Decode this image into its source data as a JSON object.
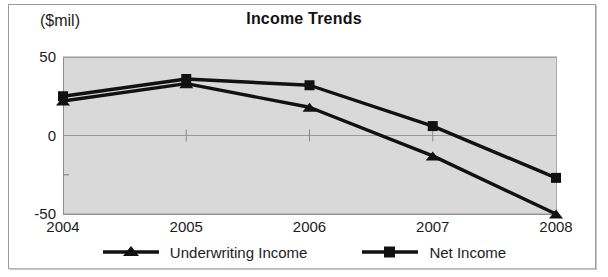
{
  "figure": {
    "axis_unit_label": "($mil)",
    "title": "Income Trends",
    "plot_bg_color": "#d9d9d9",
    "series_color": "#111111",
    "gridline_color": "#9a9a9a"
  },
  "legend": {
    "entries": [
      {
        "label": "Underwriting Income",
        "marker": "triangle-marker-icon"
      },
      {
        "label": "Net Income",
        "marker": "square-marker-icon"
      }
    ]
  },
  "chart_data": {
    "type": "line",
    "title": "Income Trends",
    "xlabel": "",
    "ylabel": "($mil)",
    "ylim": [
      -50,
      50
    ],
    "yticks": [
      50,
      0,
      -50
    ],
    "ytick_labels": [
      "50",
      "0",
      "-50"
    ],
    "yminor_ticks": [
      25,
      -25
    ],
    "grid": true,
    "legend_position": "bottom",
    "categories": [
      "2004",
      "2005",
      "2006",
      "2007",
      "2008"
    ],
    "series": [
      {
        "name": "Underwriting Income",
        "marker": "triangle",
        "values": [
          22,
          33,
          18,
          -13,
          -50
        ]
      },
      {
        "name": "Net Income",
        "marker": "square",
        "values": [
          25,
          36,
          32,
          6,
          -27
        ]
      }
    ]
  }
}
